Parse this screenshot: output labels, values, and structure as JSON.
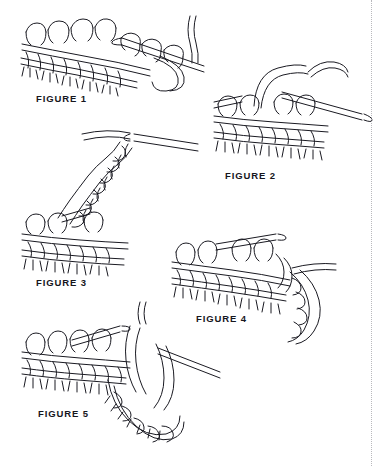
{
  "page": {
    "background_color": "#ffffff",
    "ink_color": "#1a1a22",
    "width": 388,
    "height": 466
  },
  "divider": {
    "name": "dotted-vertical-rule",
    "color": "#b9b9bd",
    "style": "dotted",
    "x": 371
  },
  "figures": [
    {
      "id": "figure-1",
      "label": "FIGURE 1",
      "label_x": 36,
      "label_y": 93,
      "description": "Knitted fabric on needle with right needle inserted and working yarn trailing right"
    },
    {
      "id": "figure-2",
      "label": "FIGURE 2",
      "label_x": 225,
      "label_y": 170,
      "description": "Two needles with a new loop drawn up over the fabric edge"
    },
    {
      "id": "figure-3",
      "label": "FIGURE 3",
      "label_x": 36,
      "label_y": 277,
      "description": "Chained cord rising diagonally up and to the right from the fabric edge"
    },
    {
      "id": "figure-4",
      "label": "FIGURE 4",
      "label_x": 196,
      "label_y": 313,
      "description": "Fabric with chain edging curving down along the right side"
    },
    {
      "id": "figure-5",
      "label": "FIGURE 5",
      "label_x": 38,
      "label_y": 408,
      "description": "Completed picot loop closed back into the fabric edge"
    }
  ]
}
